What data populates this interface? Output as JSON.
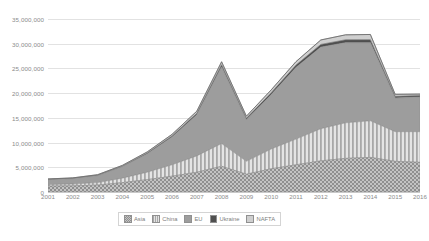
{
  "chart_data": {
    "type": "area",
    "title": "",
    "subtitle": "",
    "xlabel": "",
    "ylabel": "",
    "stacked": true,
    "grid": true,
    "legend_position": "bottom",
    "ylim": [
      0,
      35000000
    ],
    "yticks": [
      0,
      5000000,
      10000000,
      15000000,
      20000000,
      25000000,
      30000000,
      35000000
    ],
    "ytick_labels": [
      "0",
      "5,000,000",
      "10,000,000",
      "15,000,000",
      "20,000,000",
      "25,000,000",
      "30,000,000",
      "35,000,000"
    ],
    "categories": [
      2001,
      2002,
      2003,
      2004,
      2005,
      2006,
      2007,
      2008,
      2009,
      2010,
      2011,
      2012,
      2013,
      2014,
      2015,
      2016
    ],
    "xtick_labels": [
      "2001",
      "2002",
      "2003",
      "2004",
      "2005",
      "2006",
      "2007",
      "2008",
      "2009",
      "2010",
      "2011",
      "2012",
      "2013",
      "2014",
      "2015",
      "2016"
    ],
    "series": [
      {
        "name": "Asia",
        "pattern": "checker",
        "color": "#9a9a9a",
        "values": [
          1200000,
          1250000,
          1400000,
          1900000,
          2500000,
          3200000,
          4000000,
          5200000,
          3600000,
          4700000,
          5500000,
          6300000,
          6800000,
          7000000,
          6200000,
          6000000
        ]
      },
      {
        "name": "China",
        "pattern": "vertical-stripes",
        "color": "#b5b5b5",
        "values": [
          300000,
          350000,
          500000,
          900000,
          1500000,
          2300000,
          3300000,
          4600000,
          2600000,
          4000000,
          5200000,
          6500000,
          7200000,
          7400000,
          6000000,
          6200000
        ]
      },
      {
        "name": "EU",
        "pattern": "solid",
        "color": "#9d9d9d",
        "values": [
          1000000,
          1100000,
          1400000,
          2300000,
          3700000,
          5600000,
          8300000,
          15500000,
          8400000,
          11000000,
          14500000,
          16500000,
          16200000,
          15800000,
          6800000,
          7000000
        ]
      },
      {
        "name": "Ukraine",
        "pattern": "solid-dark",
        "color": "#4f4f4f",
        "values": [
          60000,
          70000,
          90000,
          130000,
          180000,
          240000,
          320000,
          450000,
          320000,
          400000,
          480000,
          560000,
          600000,
          620000,
          350000,
          300000
        ]
      },
      {
        "name": "NAFTA",
        "pattern": "light",
        "color": "#cfcfcf",
        "values": [
          80000,
          90000,
          110000,
          160000,
          230000,
          320000,
          430000,
          600000,
          420000,
          560000,
          700000,
          900000,
          1000000,
          1050000,
          400000,
          300000
        ]
      }
    ],
    "totals": [
      2640000,
      2860000,
      3500000,
      5390000,
      8110000,
      11660000,
      16350000,
      26350000,
      15340000,
      20660000,
      26380000,
      30760000,
      31800000,
      31870000,
      19750000,
      19800000
    ]
  },
  "legend": {
    "items": [
      {
        "label": "Asia"
      },
      {
        "label": "China"
      },
      {
        "label": "EU"
      },
      {
        "label": "Ukraine"
      },
      {
        "label": "NAFTA"
      }
    ]
  },
  "caption": {
    "text": ""
  }
}
